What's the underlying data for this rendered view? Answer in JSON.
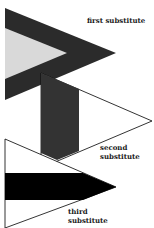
{
  "diagram": {
    "labels": {
      "first": "first substitute",
      "second_line1": "second",
      "second_line2": "substitute",
      "third_line1": "third",
      "third_line2": "substitute"
    },
    "colors": {
      "background": "#ffffff",
      "first_outer": "#2b2b2b",
      "first_inner": "#d9d9d9",
      "second_bar": "#333333",
      "third_bar": "#000000",
      "outline": "#000000"
    }
  }
}
